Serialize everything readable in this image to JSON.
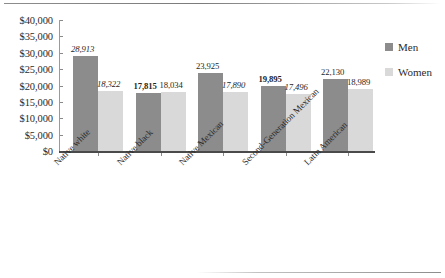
{
  "chart_data": {
    "type": "bar",
    "title": "",
    "subtitle": "",
    "xlabel": "",
    "ylabel": "",
    "ylim": [
      0,
      40000
    ],
    "grid": false,
    "legend_position": "right",
    "categories": [
      "Native white",
      "Native black",
      "Native Mexican",
      "Second-Generation Mexican",
      "Latin American"
    ],
    "y_ticks": [
      "$40,000",
      "$35,000",
      "$30,000",
      "$25,000",
      "$20,000",
      "$15,000",
      "$10,000",
      "$5,000",
      "$0"
    ],
    "y_tick_values": [
      40000,
      35000,
      30000,
      25000,
      20000,
      15000,
      10000,
      5000,
      0
    ],
    "series": [
      {
        "name": "Men",
        "color": "#8c8c8c",
        "values": [
          28913,
          17815,
          23925,
          19895,
          22130
        ],
        "labels": [
          "28,913",
          "17,815",
          "23,925",
          "19,895",
          "22,130"
        ],
        "label_styles": [
          "italic",
          "bold",
          "normal",
          "bold",
          "normal"
        ]
      },
      {
        "name": "Women",
        "color": "#d9d9d9",
        "values": [
          18322,
          18034,
          17890,
          17496,
          18989
        ],
        "labels": [
          "18,322",
          "18,034",
          "17,890",
          "17,496",
          "18,989"
        ],
        "label_styles": [
          "italic",
          "normal",
          "italic",
          "italic",
          "normal"
        ]
      }
    ]
  },
  "legend": {
    "items": [
      {
        "label": "Men",
        "color": "#8c8c8c"
      },
      {
        "label": "Women",
        "color": "#d9d9d9"
      }
    ]
  }
}
